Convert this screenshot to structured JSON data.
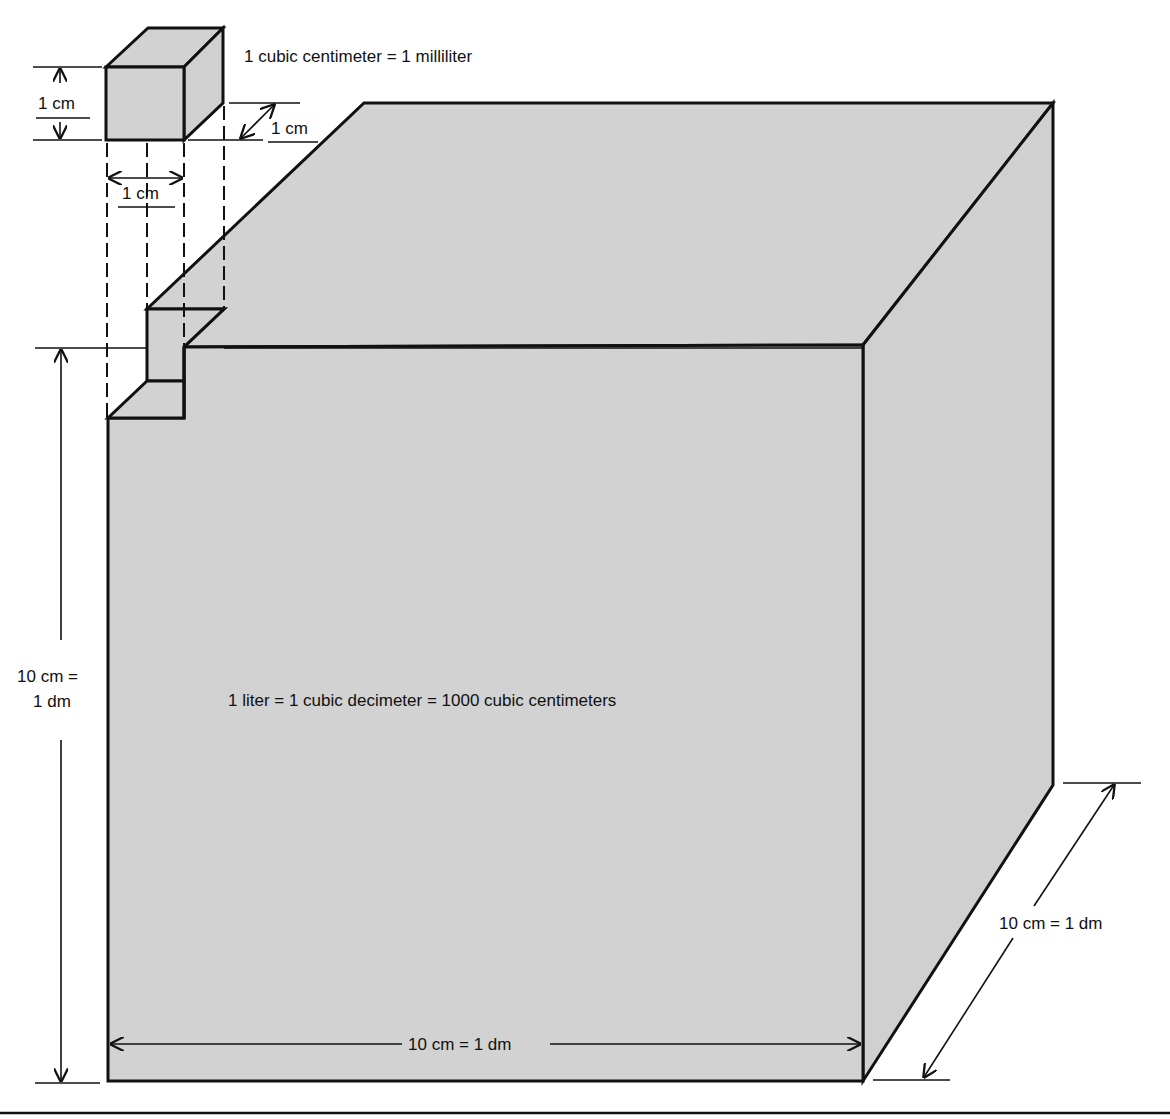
{
  "diagram": {
    "colors": {
      "fill": "#d2d2d2",
      "stroke": "#111111",
      "background": "#ffffff"
    },
    "small_cube": {
      "caption": "1 cubic centimeter = 1 milliliter",
      "height_label": "1 cm",
      "width_label": "1 cm",
      "depth_label": "1 cm"
    },
    "large_cube": {
      "caption": "1 liter = 1 cubic decimeter = 1000 cubic centimeters",
      "height_label_line1": "10 cm =",
      "height_label_line2": "1 dm",
      "width_label": "10 cm = 1 dm",
      "depth_label": "10 cm = 1 dm"
    }
  }
}
